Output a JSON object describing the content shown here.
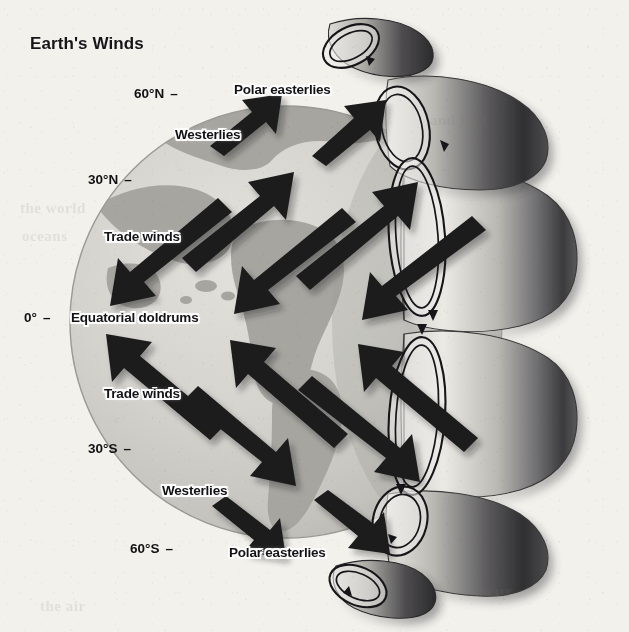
{
  "figure": {
    "title": "Earth's Winds",
    "type": "diagram",
    "medium": "scanned textbook illustration, grayscale"
  },
  "colors": {
    "page_background": "#f2f1ec",
    "globe_ocean": "#d3d2cd",
    "globe_land": "#a8a7a2",
    "globe_shadow": "#8f8e89",
    "arrow": "#1b1b1e",
    "text": "#131316",
    "label_halo": "#ffffff",
    "cell_outline": "#1b1b1e",
    "band_light": "#e7e6e1",
    "band_dark": "#4a4a4c"
  },
  "latitude_labels": [
    {
      "id": "lat-60n",
      "text": "60°N",
      "dash": "–",
      "x": 134,
      "y": 86
    },
    {
      "id": "lat-30n",
      "text": "30°N",
      "dash": "–",
      "x": 88,
      "y": 172
    },
    {
      "id": "lat-0",
      "text": "0°",
      "dash": "–",
      "x": 24,
      "y": 310
    },
    {
      "id": "lat-30s",
      "text": "30°S",
      "dash": "–",
      "x": 88,
      "y": 441
    },
    {
      "id": "lat-60s",
      "text": "60°S",
      "dash": "–",
      "x": 130,
      "y": 541
    }
  ],
  "wind_labels": [
    {
      "id": "polar-easterlies-north",
      "text": "Polar easterlies",
      "x": 234,
      "y": 82,
      "band": "polar easterlies",
      "hemisphere": "north"
    },
    {
      "id": "westerlies-north",
      "text": "Westerlies",
      "x": 175,
      "y": 127,
      "band": "westerlies",
      "hemisphere": "north"
    },
    {
      "id": "trade-winds-north",
      "text": "Trade winds",
      "x": 104,
      "y": 229,
      "band": "trade winds",
      "hemisphere": "north"
    },
    {
      "id": "equatorial-doldrums",
      "text": "Equatorial doldrums",
      "x": 71,
      "y": 310,
      "band": "doldrums",
      "hemisphere": "equator"
    },
    {
      "id": "trade-winds-south",
      "text": "Trade winds",
      "x": 104,
      "y": 386,
      "band": "trade winds",
      "hemisphere": "south"
    },
    {
      "id": "westerlies-south",
      "text": "Westerlies",
      "x": 162,
      "y": 483,
      "band": "westerlies",
      "hemisphere": "south"
    },
    {
      "id": "polar-easterlies-south",
      "text": "Polar easterlies",
      "x": 229,
      "y": 545,
      "band": "polar easterlies",
      "hemisphere": "south"
    }
  ],
  "page_bleed_text": [
    {
      "id": "bleed-top-right",
      "text": "and that",
      "x": 430,
      "y": 112,
      "size": 15
    },
    {
      "id": "bleed-mid-left",
      "text": "the world",
      "x": 20,
      "y": 200,
      "size": 15
    },
    {
      "id": "bleed-mid-left2",
      "text": "oceans",
      "x": 22,
      "y": 228,
      "size": 15
    },
    {
      "id": "bleed-bottom-right",
      "text": "occur",
      "x": 470,
      "y": 582,
      "size": 17
    },
    {
      "id": "bleed-bottom-left",
      "text": "the air",
      "x": 40,
      "y": 598,
      "size": 15
    }
  ],
  "globe": {
    "center_x": 286,
    "center_y": 322,
    "radius": 216,
    "note": "left hemisphere shaded disk with continents; right limb overlaid by 3-D atmospheric circulation bands"
  },
  "circulation_cells": [
    {
      "id": "polar-cell-north",
      "name": "polar cell north",
      "cx": 351,
      "cy": 46,
      "rx": 30,
      "ry": 19,
      "rotation": -28,
      "spin": "clockwise"
    },
    {
      "id": "ferrel-cell-north",
      "name": "ferrel cell north",
      "cx": 402,
      "cy": 128,
      "rx": 27,
      "ry": 42,
      "rotation": -12,
      "spin": "clockwise"
    },
    {
      "id": "hadley-cell-north",
      "name": "hadley cell north",
      "cx": 417,
      "cy": 237,
      "rx": 28,
      "ry": 79,
      "rotation": -4,
      "spin": "clockwise"
    },
    {
      "id": "hadley-cell-south",
      "name": "hadley cell south",
      "cx": 417,
      "cy": 416,
      "rx": 28,
      "ry": 79,
      "rotation": 4,
      "spin": "counterclockwise"
    },
    {
      "id": "ferrel-cell-south",
      "name": "ferrel cell south",
      "cx": 400,
      "cy": 521,
      "rx": 27,
      "ry": 35,
      "rotation": 14,
      "spin": "counterclockwise"
    },
    {
      "id": "polar-cell-south",
      "name": "polar cell south",
      "cx": 358,
      "cy": 586,
      "rx": 30,
      "ry": 19,
      "rotation": 24,
      "spin": "counterclockwise"
    }
  ],
  "wind_arrows": [
    {
      "id": "arrow-polar-e-n-1",
      "band": "polar easterlies",
      "direction": "northeast",
      "x1": 214,
      "y1": 140,
      "x2": 272,
      "y2": 98
    },
    {
      "id": "arrow-polar-e-n-2",
      "band": "polar easterlies",
      "direction": "northeast",
      "x1": 316,
      "y1": 150,
      "x2": 374,
      "y2": 104
    },
    {
      "id": "arrow-westerlies-n-1",
      "band": "westerlies",
      "direction": "northeast",
      "x1": 188,
      "y1": 250,
      "x2": 276,
      "y2": 178
    },
    {
      "id": "arrow-westerlies-n-2",
      "band": "westerlies",
      "direction": "northeast",
      "x1": 300,
      "y1": 268,
      "x2": 400,
      "y2": 188
    },
    {
      "id": "arrow-trade-n-1",
      "band": "trade winds",
      "direction": "southwest",
      "x1": 226,
      "y1": 218,
      "x2": 104,
      "y2": 300
    },
    {
      "id": "arrow-trade-n-2",
      "band": "trade winds",
      "direction": "southwest",
      "x1": 350,
      "y1": 228,
      "x2": 228,
      "y2": 304
    },
    {
      "id": "arrow-trade-n-3",
      "band": "trade winds",
      "direction": "southwest",
      "x1": 478,
      "y1": 236,
      "x2": 356,
      "y2": 304
    },
    {
      "id": "arrow-trade-s-1",
      "band": "trade winds",
      "direction": "northwest",
      "x1": 218,
      "y1": 420,
      "x2": 104,
      "y2": 344
    },
    {
      "id": "arrow-trade-s-2",
      "band": "trade winds",
      "direction": "northwest",
      "x1": 342,
      "y1": 428,
      "x2": 228,
      "y2": 348
    },
    {
      "id": "arrow-trade-s-3",
      "band": "trade winds",
      "direction": "northwest",
      "x1": 470,
      "y1": 432,
      "x2": 356,
      "y2": 350
    },
    {
      "id": "arrow-westerlies-s-1",
      "band": "westerlies",
      "direction": "southeast",
      "x1": 190,
      "y1": 408,
      "x2": 278,
      "y2": 482
    },
    {
      "id": "arrow-westerlies-s-2",
      "band": "westerlies",
      "direction": "southeast",
      "x1": 302,
      "y1": 398,
      "x2": 400,
      "y2": 476
    },
    {
      "id": "arrow-polar-e-s-1",
      "band": "polar easterlies",
      "direction": "southeast",
      "x1": 216,
      "y1": 512,
      "x2": 272,
      "y2": 552
    },
    {
      "id": "arrow-polar-e-s-2",
      "band": "polar easterlies",
      "direction": "southeast",
      "x1": 318,
      "y1": 506,
      "x2": 376,
      "y2": 548
    }
  ]
}
